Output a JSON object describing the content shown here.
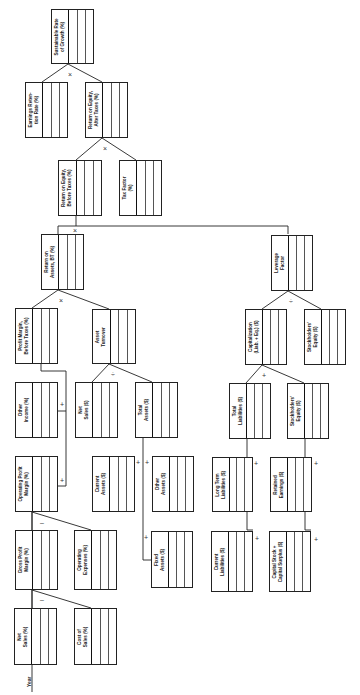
{
  "diagram": {
    "axis_label": "Year",
    "nodes": [
      {
        "id": "sgr",
        "label": "Sustainable Rate\nof Growth (%)"
      },
      {
        "id": "err",
        "label": "Earnings Reten-\ntion Rate (%)"
      },
      {
        "id": "roe_at",
        "label": "Return on Equity,\nAfter Taxes (%)"
      },
      {
        "id": "roe_bt",
        "label": "Return on Equity,\nBefore Taxes (%)"
      },
      {
        "id": "tax",
        "label": "Tax Factor\n(%)"
      },
      {
        "id": "roa",
        "label": "Return on\nAssets, BT (%)"
      },
      {
        "id": "lev",
        "label": "Leverage\nFactor"
      },
      {
        "id": "pm",
        "label": "Profit Margin,\nBefore Taxes (%)"
      },
      {
        "id": "at",
        "label": "Asset\nTurnover"
      },
      {
        "id": "cap",
        "label": "Capitalization\n(Liab. + Eq.) ($)"
      },
      {
        "id": "se1",
        "label": "Stockholders'\nEquity ($)"
      },
      {
        "id": "oi",
        "label": "Other\nIncome (%)"
      },
      {
        "id": "ns_d",
        "label": "Net\nSales ($)"
      },
      {
        "id": "ta",
        "label": "Total\nAssets ($)"
      },
      {
        "id": "tl",
        "label": "Total\nLiabilities ($)"
      },
      {
        "id": "se2",
        "label": "Stockholders'\nEquity ($)"
      },
      {
        "id": "opm",
        "label": "Operating Profit\nMargin (%)"
      },
      {
        "id": "ca",
        "label": "Current\nAssets ($)"
      },
      {
        "id": "oa",
        "label": "Other\nAssets ($)"
      },
      {
        "id": "ltl",
        "label": "Long Term\nLiabilities ($)"
      },
      {
        "id": "re",
        "label": "Retained\nEarnings ($)"
      },
      {
        "id": "gpm",
        "label": "Gross Profit\nMargin (%)"
      },
      {
        "id": "opex",
        "label": "Operating\nExpenses (%)"
      },
      {
        "id": "fa",
        "label": "Fixed\nAssets ($)"
      },
      {
        "id": "cl",
        "label": "Current\nLiabilities ($)"
      },
      {
        "id": "cs",
        "label": "Capital Stock +\nCapital Surplus ($)"
      },
      {
        "id": "ns_p",
        "label": "Net\nSales (%)"
      },
      {
        "id": "cos",
        "label": "Cost of\nSales (%)"
      }
    ],
    "operators": {
      "times": "×",
      "divide": "÷",
      "plus": "+",
      "minus": "–"
    }
  }
}
